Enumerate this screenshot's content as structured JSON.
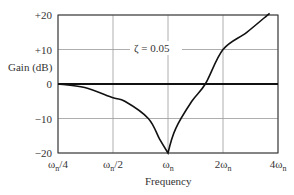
{
  "chart_data": {
    "type": "line",
    "title": "",
    "xlabel": "Frequency",
    "ylabel": "Gain (dB)",
    "xscale": "log2",
    "x_tick_labels": [
      "ωn/4",
      "ωn/2",
      "ωn",
      "2ωn",
      "4ωn"
    ],
    "x_tick_values": [
      0.25,
      0.5,
      1,
      2,
      4
    ],
    "y_tick_labels": [
      "+20",
      "+10",
      "0",
      "−10",
      "−20"
    ],
    "y_tick_values": [
      20,
      10,
      0,
      -10,
      -20
    ],
    "ylim": [
      -20,
      20
    ],
    "xlim": [
      0.25,
      4
    ],
    "grid": true,
    "annotations": [
      {
        "text": "ζ = 0.05",
        "x": 1.6,
        "y": 10
      }
    ],
    "series": [
      {
        "name": "ζ = 0.05",
        "x_over_wn": [
          0.25,
          0.35,
          0.5,
          0.58,
          0.78,
          0.9,
          1.0,
          1.1,
          1.35,
          1.6,
          2.0,
          2.7,
          3.6
        ],
        "values": [
          0,
          -1,
          -4,
          -5,
          -10,
          -16,
          -20,
          -13,
          -5,
          0,
          10,
          15,
          20.5
        ]
      }
    ]
  },
  "labels": {
    "ylabel": "Gain (dB)",
    "xlabel": "Frequency",
    "annotation": "ζ = 0.05",
    "yticks": [
      "+20",
      "+10",
      "0",
      "−10",
      "−20"
    ],
    "xticks_base": [
      "ω",
      "ω",
      "ω",
      "2ω",
      "4ω"
    ],
    "xticks_suffix": [
      "/4",
      "/2",
      "",
      "",
      ""
    ],
    "xticks_sub": [
      "n",
      "n",
      "n",
      "n",
      "n"
    ]
  }
}
